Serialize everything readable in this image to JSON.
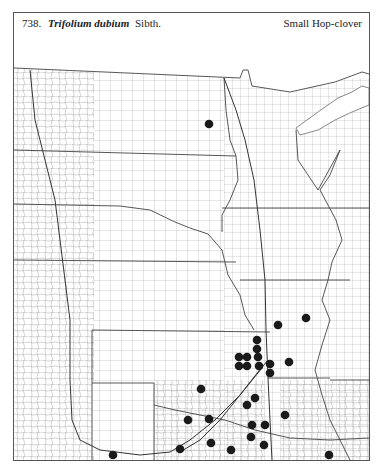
{
  "page": {
    "species_number": "738.",
    "scientific_name": "Trifolium dubium",
    "authority": "Sibth.",
    "common_name": "Small Hop-clover"
  },
  "map": {
    "region": "Great Plains (county outline map)",
    "dot_color": "#1a1a1a",
    "line_color": "#555555",
    "occurrence_dots": [
      {
        "x": 209,
        "y": 124
      },
      {
        "x": 306,
        "y": 318
      },
      {
        "x": 278,
        "y": 325
      },
      {
        "x": 257,
        "y": 340
      },
      {
        "x": 257,
        "y": 349
      },
      {
        "x": 239,
        "y": 357
      },
      {
        "x": 247,
        "y": 357
      },
      {
        "x": 258,
        "y": 357
      },
      {
        "x": 239,
        "y": 366
      },
      {
        "x": 247,
        "y": 366
      },
      {
        "x": 259,
        "y": 366
      },
      {
        "x": 270,
        "y": 364
      },
      {
        "x": 270,
        "y": 373
      },
      {
        "x": 289,
        "y": 362
      },
      {
        "x": 201,
        "y": 389
      },
      {
        "x": 255,
        "y": 398
      },
      {
        "x": 247,
        "y": 405
      },
      {
        "x": 285,
        "y": 415
      },
      {
        "x": 188,
        "y": 420
      },
      {
        "x": 209,
        "y": 419
      },
      {
        "x": 252,
        "y": 425
      },
      {
        "x": 265,
        "y": 425
      },
      {
        "x": 251,
        "y": 437
      },
      {
        "x": 211,
        "y": 443
      },
      {
        "x": 264,
        "y": 445
      },
      {
        "x": 180,
        "y": 449
      },
      {
        "x": 231,
        "y": 450
      },
      {
        "x": 113,
        "y": 455
      },
      {
        "x": 329,
        "y": 455
      }
    ]
  }
}
